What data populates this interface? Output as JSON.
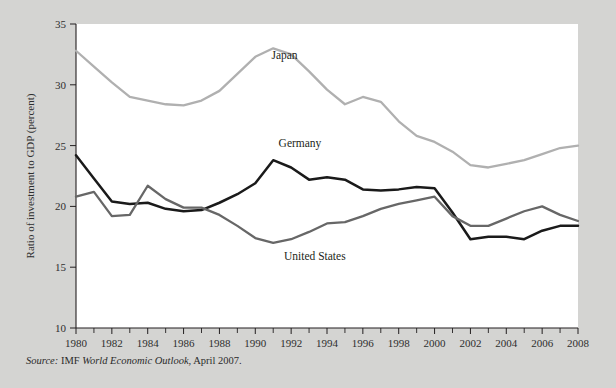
{
  "figure": {
    "background_color": "#d4d4d2",
    "plot_background_color": "#ffffff",
    "source_prefix": "Source:",
    "source_org": "IMF",
    "source_title": "World Economic Outlook",
    "source_date": ", April 2007."
  },
  "chart_data": {
    "type": "line",
    "title": "",
    "xlabel": "",
    "ylabel": "Ratio of investment to GDP (percent)",
    "xlim": [
      1980,
      2008
    ],
    "ylim": [
      10,
      35
    ],
    "yticks": [
      10,
      15,
      20,
      25,
      30,
      35
    ],
    "xticks": [
      1980,
      1982,
      1984,
      1986,
      1988,
      1990,
      1992,
      1994,
      1996,
      1998,
      2000,
      2002,
      2004,
      2006,
      2008
    ],
    "xticks_minor_every": 1,
    "grid": false,
    "legend": "inline-annotations",
    "x": [
      1980,
      1981,
      1982,
      1983,
      1984,
      1985,
      1986,
      1987,
      1988,
      1989,
      1990,
      1991,
      1992,
      1993,
      1994,
      1995,
      1996,
      1997,
      1998,
      1999,
      2000,
      2001,
      2002,
      2003,
      2004,
      2005,
      2006,
      2007,
      2008
    ],
    "series": [
      {
        "name": "Japan",
        "color": "#b0b0b0",
        "label_x": 1990.9,
        "label_y": 32.1,
        "values": [
          32.8,
          31.5,
          30.2,
          29.0,
          28.7,
          28.4,
          28.3,
          28.7,
          29.5,
          30.9,
          32.3,
          33.0,
          32.5,
          31.1,
          29.6,
          28.4,
          29.0,
          28.6,
          27.0,
          25.8,
          25.3,
          24.5,
          23.4,
          23.2,
          23.5,
          23.8,
          24.3,
          24.8,
          25.0
        ]
      },
      {
        "name": "Germany",
        "color": "#1a1a1a",
        "label_x": 1991.3,
        "label_y": 24.9,
        "values": [
          24.2,
          22.3,
          20.4,
          20.2,
          20.3,
          19.8,
          19.6,
          19.7,
          20.3,
          21.0,
          21.9,
          23.8,
          23.2,
          22.2,
          22.4,
          22.2,
          21.4,
          21.3,
          21.4,
          21.6,
          21.5,
          19.5,
          17.3,
          17.5,
          17.5,
          17.3,
          18.0,
          18.4,
          18.4
        ]
      },
      {
        "name": "United States",
        "color": "#676767",
        "label_x": 1991.6,
        "label_y": 15.6,
        "values": [
          20.8,
          21.2,
          19.2,
          19.3,
          21.7,
          20.6,
          19.9,
          19.9,
          19.3,
          18.4,
          17.4,
          17.0,
          17.3,
          17.9,
          18.6,
          18.7,
          19.2,
          19.8,
          20.2,
          20.5,
          20.8,
          19.2,
          18.4,
          18.4,
          19.0,
          19.6,
          20.0,
          19.3,
          18.8
        ]
      }
    ]
  }
}
